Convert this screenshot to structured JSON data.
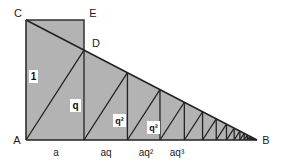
{
  "diagram": {
    "points": {
      "A": {
        "label": "A",
        "x": 26,
        "y": 140
      },
      "B": {
        "label": "B",
        "x": 257,
        "y": 140
      },
      "C": {
        "label": "C",
        "x": 26,
        "y": 20
      },
      "D": {
        "label": "D",
        "x": 84,
        "y": 50
      },
      "E": {
        "label": "E",
        "x": 84,
        "y": 20
      }
    },
    "height_labels": [
      "1",
      "q",
      "q²",
      "q³"
    ],
    "base_labels": [
      "a",
      "aq",
      "aq²",
      "aq³"
    ],
    "colors": {
      "fill": "#b3b3b3",
      "stroke": "#222222",
      "label_box": "#ffffff"
    }
  }
}
